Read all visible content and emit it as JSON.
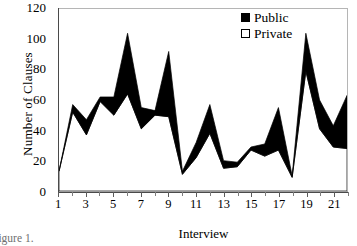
{
  "figure": {
    "caption": "Figure 1."
  },
  "legend": {
    "position": "top-right",
    "items": [
      {
        "label": "Public",
        "swatch": "filled-black-square",
        "color": "#000000"
      },
      {
        "label": "Private",
        "swatch": "hollow-white-square",
        "color": "#ffffff"
      }
    ]
  },
  "axes": {
    "y_title": "Number of Clauses",
    "x_title": "Interview",
    "y_ticks": [
      0,
      20,
      40,
      60,
      80,
      100,
      120
    ],
    "x_ticks_labeled": [
      1,
      3,
      5,
      7,
      9,
      11,
      13,
      15,
      17,
      19,
      21
    ]
  },
  "chart_data": {
    "type": "area",
    "title": "",
    "subtitle": "",
    "xlabel": "Interview",
    "ylabel": "Number of Clauses",
    "xlim": [
      1,
      22
    ],
    "ylim": [
      0,
      120
    ],
    "ytick_step": 20,
    "grid": false,
    "legend_position": "top-right",
    "stacked": true,
    "x": [
      1,
      2,
      3,
      4,
      5,
      6,
      7,
      8,
      9,
      10,
      11,
      12,
      13,
      14,
      15,
      16,
      17,
      18,
      19,
      20,
      21,
      22
    ],
    "categories": [
      "1",
      "2",
      "3",
      "4",
      "5",
      "6",
      "7",
      "8",
      "9",
      "10",
      "11",
      "12",
      "13",
      "14",
      "15",
      "16",
      "17",
      "18",
      "19",
      "20",
      "21",
      "22"
    ],
    "series": [
      {
        "name": "Private",
        "color": "#ffffff",
        "stack_order": 1,
        "values": [
          13,
          52,
          37,
          59,
          50,
          64,
          41,
          50,
          49,
          11,
          22,
          38,
          15,
          16,
          27,
          23,
          27,
          9,
          79,
          41,
          29,
          28
        ]
      },
      {
        "name": "Public",
        "color": "#000000",
        "stack_order": 2,
        "values": [
          0,
          5,
          10,
          3,
          12,
          40,
          14,
          3,
          43,
          2,
          10,
          19,
          5,
          3,
          2,
          8,
          28,
          1,
          25,
          19,
          14,
          35
        ]
      }
    ],
    "totals": {
      "name": "Public + Private (stacked top)",
      "values": [
        13,
        57,
        47,
        62,
        62,
        104,
        55,
        53,
        92,
        13,
        32,
        57,
        20,
        19,
        29,
        31,
        55,
        10,
        104,
        60,
        43,
        63
      ]
    }
  }
}
